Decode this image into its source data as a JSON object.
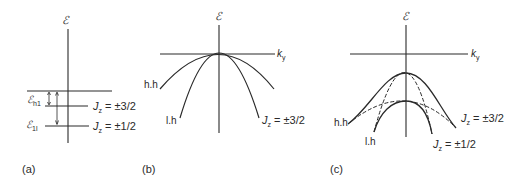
{
  "figure": {
    "panels": [
      {
        "id": "a",
        "caption": "(a)",
        "axis_label_y": "ℰ",
        "levels": [
          {
            "name": "band-edge",
            "label": ""
          },
          {
            "name": "heavy-hole",
            "label_main": "ℰ",
            "label_sub": "h1",
            "jz_label": "J",
            "jz_sub": "z",
            "jz_value": " = ±3/2"
          },
          {
            "name": "light-hole",
            "label_main": "ℰ",
            "label_sub": "1l",
            "jz_label": "J",
            "jz_sub": "z",
            "jz_value": " = ±1/2"
          }
        ]
      },
      {
        "id": "b",
        "caption": "(b)",
        "axis_label_y": "ℰ",
        "axis_label_x": "k",
        "axis_label_x_sub": "y",
        "curves": [
          {
            "name": "heavy-hole",
            "label": "h.h"
          },
          {
            "name": "light-hole",
            "label": "l.h"
          }
        ],
        "jz_label": "J",
        "jz_sub": "z",
        "jz_value": " = ±3/2"
      },
      {
        "id": "c",
        "caption": "(c)",
        "axis_label_y": "ℰ",
        "axis_label_x": "k",
        "axis_label_x_sub": "y",
        "curves": [
          {
            "name": "heavy-hole",
            "label": "h.h"
          },
          {
            "name": "light-hole",
            "label": "l.h"
          }
        ],
        "jz_upper": {
          "label": "J",
          "sub": "z",
          "value": " = ±3/2"
        },
        "jz_lower": {
          "label": "J",
          "sub": "z",
          "value": " = ±1/2"
        }
      }
    ],
    "colors": {
      "ink": "#2a2a2a",
      "background": "#ffffff"
    }
  }
}
